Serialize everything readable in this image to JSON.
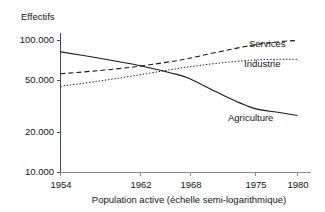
{
  "chart_data": {
    "type": "line",
    "title": "",
    "subtitle": "",
    "ylabel": "Effectifs",
    "xlabel": "Population active (échelle semi-logarithmique)",
    "caption": "Population active (échelle semi-logarithmique)",
    "yscale": "log",
    "ylim": [
      10000,
      100000
    ],
    "xlim": [
      1954,
      1980
    ],
    "grid": false,
    "legend_position": "inline-right",
    "y_ticks": [
      {
        "value": 100000,
        "label": "100.000"
      },
      {
        "value": 50000,
        "label": "50.000"
      },
      {
        "value": 20000,
        "label": "20.000"
      },
      {
        "value": 10000,
        "label": "10.000"
      }
    ],
    "x_ticks": [
      {
        "value": 1954,
        "label": "1954"
      },
      {
        "value": 1962,
        "label": "1962"
      },
      {
        "value": 1968,
        "label": "1968"
      },
      {
        "value": 1975,
        "label": "1975"
      },
      {
        "value": 1980,
        "label": "1980"
      }
    ],
    "series": [
      {
        "name": "Agriculture",
        "style": "solid",
        "color": "#1a1a1a",
        "x": [
          1954,
          1958,
          1962,
          1966,
          1968,
          1971,
          1975,
          1978,
          1980
        ],
        "values": [
          82000,
          74000,
          66000,
          57000,
          52000,
          41000,
          31000,
          28500,
          27000
        ]
      },
      {
        "name": "Services",
        "style": "dashed",
        "color": "#1a1a1a",
        "x": [
          1954,
          1958,
          1962,
          1966,
          1968,
          1971,
          1975,
          1978,
          1980
        ],
        "values": [
          56000,
          59000,
          63000,
          69000,
          73000,
          81000,
          92000,
          98000,
          100000
        ]
      },
      {
        "name": "Industrie",
        "style": "dotted",
        "color": "#1a1a1a",
        "x": [
          1954,
          1958,
          1962,
          1966,
          1968,
          1971,
          1975,
          1978,
          1980
        ],
        "values": [
          45000,
          49000,
          54000,
          60000,
          63000,
          67000,
          71000,
          72000,
          72000
        ]
      }
    ],
    "annotations": [
      {
        "text": "Services",
        "series": "Services"
      },
      {
        "text": "Industrie",
        "series": "Industrie"
      },
      {
        "text": "Agriculture",
        "series": "Agriculture"
      }
    ]
  }
}
